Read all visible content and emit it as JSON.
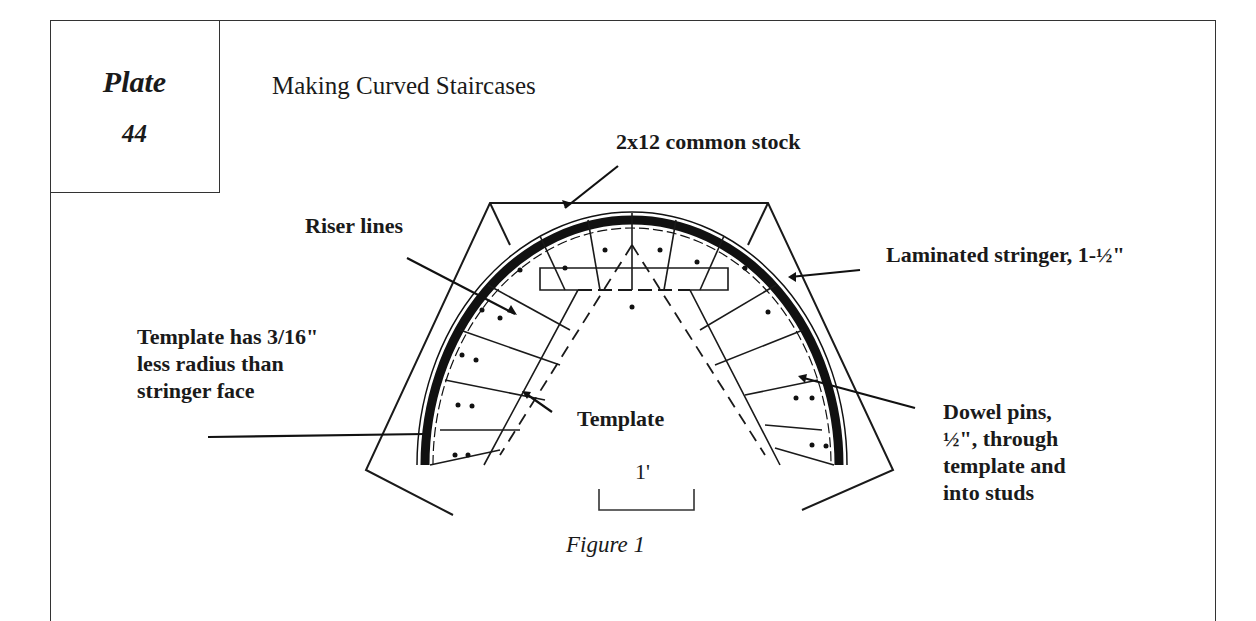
{
  "plate": {
    "word": "Plate",
    "number": "44"
  },
  "title": "Making Curved Staircases",
  "figure": {
    "caption": "Figure 1",
    "scale_label": "1'",
    "labels": {
      "common_stock": "2x12 common stock",
      "riser_lines": "Riser lines",
      "laminated_stringer": "Laminated stringer, 1-½\"",
      "template_note_line1": "Template has 3/16\"",
      "template_note_line2": "less radius than",
      "template_note_line3": "stringer face",
      "template": "Template",
      "dowel_line1": "Dowel pins,",
      "dowel_line2": "½\", through",
      "dowel_line3": "template and",
      "dowel_line4": "into studs"
    }
  },
  "colors": {
    "ink": "#1a1a1a",
    "paper": "#ffffff",
    "frame": "#333333"
  }
}
